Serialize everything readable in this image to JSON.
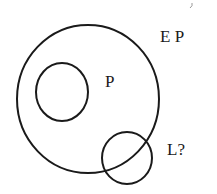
{
  "diagram": {
    "type": "venn",
    "stroke_color": "#1a1a1a",
    "background": "#ffffff",
    "shapes": [
      {
        "name": "outer-circle",
        "label": "E P",
        "cx": 88,
        "cy": 99,
        "rx": 71,
        "ry": 74
      },
      {
        "name": "inner-circle",
        "cx": 62,
        "cy": 92,
        "rx": 26,
        "ry": 29
      },
      {
        "name": "overlap-circle",
        "label": "L?",
        "cx": 127,
        "cy": 158,
        "rx": 25,
        "ry": 26
      }
    ],
    "labels": {
      "outer": "E P",
      "inner": "P",
      "overlap": "L?"
    }
  }
}
